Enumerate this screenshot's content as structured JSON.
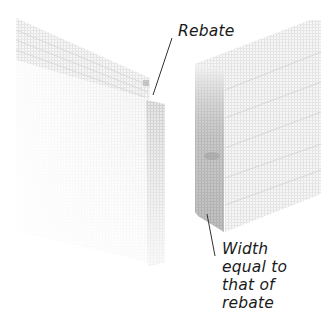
{
  "diagram": {
    "labels": {
      "rebate": "Rebate",
      "width_note": {
        "line1": "Width",
        "line2": "equal to",
        "line3": "that of",
        "line4": "rebate"
      }
    },
    "colors": {
      "background": "#ffffff",
      "wood_light": "#f2f2f2",
      "wood_grain": "#c8c8c8",
      "wood_shade": "#a8a8a8",
      "leader_line": "#333333",
      "text": "#1a1a1a"
    },
    "parts": [
      {
        "name": "left-board",
        "description": "Board with rebate cut along its edge"
      },
      {
        "name": "right-board",
        "description": "Board whose thickness equals the rebate width"
      }
    ]
  }
}
